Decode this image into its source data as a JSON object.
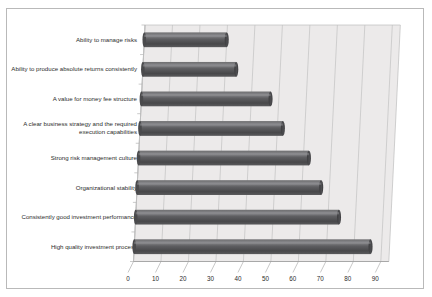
{
  "chart_data": {
    "type": "bar",
    "orientation": "horizontal",
    "title": "",
    "subtitle": "",
    "xlabel": "",
    "ylabel": "",
    "xlim": [
      0,
      90
    ],
    "xticks": [
      0,
      10,
      20,
      30,
      40,
      50,
      60,
      70,
      80,
      90
    ],
    "grid": true,
    "legend": false,
    "style": "3d-cylinder",
    "bar_color": "#58585a",
    "plot_background": "#eceaea",
    "categories": [
      "Ability to manage risks",
      "Ability to produce absolute returns consistently",
      "A value for money fee structure",
      "A clear business strategy and the required execution capabilities",
      "Strong risk management culture",
      "Organizational stability",
      "Consistently good investment performance",
      "High quality investment process"
    ],
    "values": [
      30,
      34,
      47,
      52,
      62,
      67,
      74,
      86
    ]
  }
}
